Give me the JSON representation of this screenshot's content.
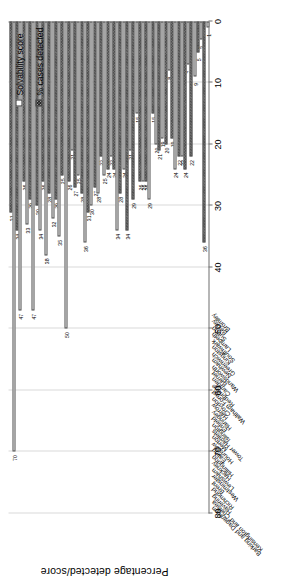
{
  "chart_data": {
    "type": "bar",
    "orientation": "horizontal-rotated",
    "title": "",
    "xlabel": "",
    "ylabel": "Percentage detected/score",
    "ylim": [
      0,
      80
    ],
    "yticks": [
      "0",
      "10",
      "20",
      "30",
      "40",
      "50",
      "60",
      "70",
      "80"
    ],
    "grid": true,
    "legend_position": "top-right",
    "categories": [
      "Barking and Dagenham",
      "Kensington and Chelsea",
      "Havering",
      "Richmond",
      "Brent",
      "Westminster",
      "Lewisham",
      "Hackney",
      "Hillingdon",
      "Ealing",
      "Hounslow",
      "Merton",
      "Tower Hamlets",
      "Islington",
      "Enfield",
      "Haringey",
      "Harrow",
      "Croydon",
      "Waltham Forest",
      "Redbridge",
      "Camden",
      "Barnet",
      "Wandsworth",
      "Newham",
      "Greenwich",
      "Kingston",
      "Southwark",
      "Lambeth",
      "Sutton",
      "Bexley",
      "Bromley"
    ],
    "series": [
      {
        "name": "Solvability score",
        "values": [
          70,
          47,
          33,
          47,
          34,
          38,
          32,
          35,
          50,
          21,
          25,
          36,
          30,
          28,
          25,
          22,
          34,
          24,
          21,
          15,
          26,
          29,
          20,
          19,
          8,
          24,
          22,
          7,
          9,
          3,
          1
        ]
      },
      {
        "name": "% cases detected",
        "values": [
          31,
          34,
          26,
          29,
          30,
          26,
          28,
          29,
          25,
          26,
          27,
          28,
          31,
          27,
          22,
          24,
          24,
          28,
          34,
          29,
          26,
          26,
          15,
          21,
          20,
          19,
          22,
          24,
          22,
          5,
          36
        ]
      }
    ]
  },
  "legend": {
    "items": [
      {
        "label": "Solvability score",
        "swatch": "hollow-white"
      },
      {
        "label": "% cases detected",
        "swatch": "dark-hatched"
      }
    ]
  },
  "colors": {
    "solvability_fill": "#ffffff",
    "detected_fill": "#9a9a9a",
    "bar_outline": "#4a4a4a",
    "gridline": "#d9d9d9",
    "axis": "#6f6f6f",
    "background": "#ffffff"
  }
}
